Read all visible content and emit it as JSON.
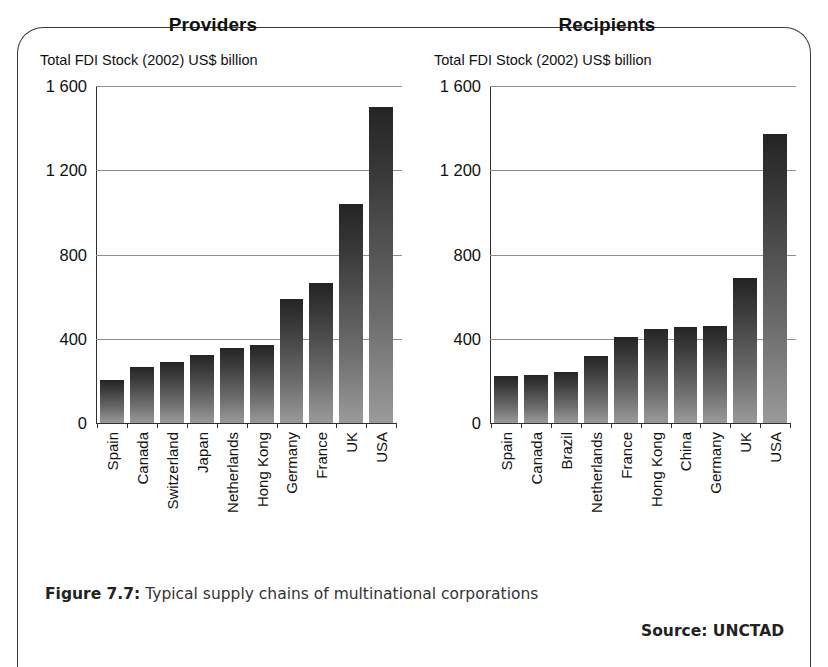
{
  "figure": {
    "caption_label": "Figure 7.7:",
    "caption_text": " Typical supply chains of multinational corporations",
    "source": "Source: UNCTAD"
  },
  "chart_data": [
    {
      "type": "bar",
      "title": "Providers",
      "ylabel": "Total FDI Stock (2002) US$ billion",
      "xlabel": "",
      "ylim": [
        0,
        1600
      ],
      "yticks": [
        0,
        400,
        800,
        1200,
        1600
      ],
      "ytick_labels": [
        "0",
        "400",
        "800",
        "1 200",
        "1 600"
      ],
      "grid": true,
      "legend": "none",
      "categories": [
        "Spain",
        "Canada",
        "Switzerland",
        "Japan",
        "Netherlands",
        "Hong Kong",
        "Germany",
        "France",
        "UK",
        "USA"
      ],
      "values": [
        205,
        265,
        290,
        325,
        355,
        370,
        590,
        665,
        1040,
        1500
      ]
    },
    {
      "type": "bar",
      "title": "Recipients",
      "ylabel": "Total FDI Stock (2002) US$ billion",
      "xlabel": "",
      "ylim": [
        0,
        1600
      ],
      "yticks": [
        0,
        400,
        800,
        1200,
        1600
      ],
      "ytick_labels": [
        "0",
        "400",
        "800",
        "1 200",
        "1 600"
      ],
      "grid": true,
      "legend": "none",
      "categories": [
        "Spain",
        "Canada",
        "Brazil",
        "Netherlands",
        "France",
        "Hong Kong",
        "China",
        "Germany",
        "UK",
        "USA"
      ],
      "values": [
        225,
        228,
        240,
        320,
        410,
        445,
        455,
        462,
        690,
        1370
      ]
    }
  ]
}
